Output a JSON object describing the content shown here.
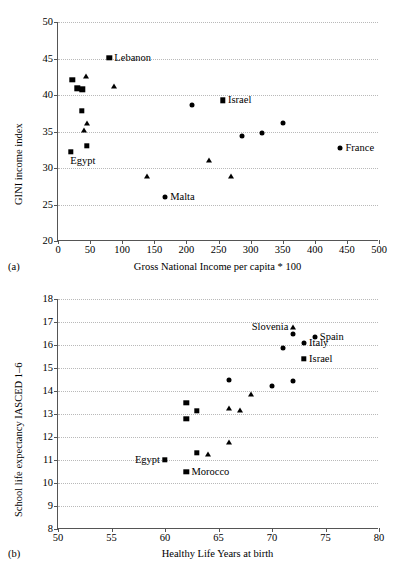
{
  "figure": {
    "panel_a_tag": "(a)",
    "panel_b_tag": "(b)"
  },
  "chart_data": [
    {
      "id": "a",
      "type": "scatter",
      "title": "",
      "xlabel": "Gross National Income per capita * 100",
      "ylabel": "GINI income index",
      "xlim": [
        0,
        500
      ],
      "ylim": [
        20,
        50
      ],
      "xticks": [
        0,
        50,
        100,
        150,
        200,
        250,
        300,
        350,
        400,
        450,
        500
      ],
      "yticks": [
        20,
        25,
        30,
        35,
        40,
        45,
        50
      ],
      "grid": "horizontal-dotted",
      "legend": "none",
      "series": [
        {
          "name": "square-markers",
          "marker": "square",
          "points": [
            {
              "x": 80,
              "y": 45.1,
              "label": "Lebanon",
              "label_pos": "right"
            },
            {
              "x": 22,
              "y": 42.1,
              "label": "",
              "label_pos": ""
            },
            {
              "x": 30,
              "y": 40.9,
              "label": "",
              "label_pos": ""
            },
            {
              "x": 38,
              "y": 40.8,
              "label": "",
              "label_pos": ""
            },
            {
              "x": 37,
              "y": 37.8,
              "label": "",
              "label_pos": ""
            },
            {
              "x": 45,
              "y": 33.0,
              "label": "",
              "label_pos": ""
            },
            {
              "x": 20,
              "y": 32.2,
              "label": "Egypt",
              "label_pos": "below"
            },
            {
              "x": 257,
              "y": 39.3,
              "label": "Israel",
              "label_pos": "right"
            }
          ]
        },
        {
          "name": "triangle-markers",
          "marker": "triangle",
          "points": [
            {
              "x": 44,
              "y": 42.7,
              "label": "",
              "label_pos": ""
            },
            {
              "x": 87,
              "y": 41.3,
              "label": "",
              "label_pos": ""
            },
            {
              "x": 45,
              "y": 36.3,
              "label": "",
              "label_pos": ""
            },
            {
              "x": 41,
              "y": 35.3,
              "label": "",
              "label_pos": ""
            },
            {
              "x": 235,
              "y": 31.2,
              "label": "",
              "label_pos": ""
            },
            {
              "x": 138,
              "y": 29.0,
              "label": "",
              "label_pos": ""
            },
            {
              "x": 269,
              "y": 29.0,
              "label": "",
              "label_pos": ""
            }
          ]
        },
        {
          "name": "circle-markers",
          "marker": "circle",
          "points": [
            {
              "x": 209,
              "y": 38.6,
              "label": "",
              "label_pos": ""
            },
            {
              "x": 351,
              "y": 36.1,
              "label": "",
              "label_pos": ""
            },
            {
              "x": 318,
              "y": 34.8,
              "label": "",
              "label_pos": ""
            },
            {
              "x": 287,
              "y": 34.4,
              "label": "",
              "label_pos": ""
            },
            {
              "x": 440,
              "y": 32.8,
              "label": "France",
              "label_pos": "right"
            },
            {
              "x": 167,
              "y": 26.0,
              "label": "Malta",
              "label_pos": "right"
            }
          ]
        }
      ]
    },
    {
      "id": "b",
      "type": "scatter",
      "title": "",
      "xlabel": "Healthy Life Years at birth",
      "ylabel": "School life expectancy IASCED 1–6",
      "xlim": [
        50,
        80
      ],
      "ylim": [
        8,
        18
      ],
      "xticks": [
        50,
        55,
        60,
        65,
        70,
        75,
        80
      ],
      "yticks": [
        8,
        9,
        10,
        11,
        12,
        13,
        14,
        15,
        16,
        17,
        18
      ],
      "grid": "horizontal-dotted",
      "legend": "none",
      "series": [
        {
          "name": "square-markers",
          "marker": "square",
          "points": [
            {
              "x": 73.0,
              "y": 15.4,
              "label": "Israel",
              "label_pos": "right"
            },
            {
              "x": 62.0,
              "y": 13.5,
              "label": "",
              "label_pos": ""
            },
            {
              "x": 63.0,
              "y": 13.15,
              "label": "",
              "label_pos": ""
            },
            {
              "x": 62.0,
              "y": 12.8,
              "label": "",
              "label_pos": ""
            },
            {
              "x": 63.0,
              "y": 11.3,
              "label": "",
              "label_pos": ""
            },
            {
              "x": 60.0,
              "y": 11.0,
              "label": "Egypt",
              "label_pos": "left"
            },
            {
              "x": 62.0,
              "y": 10.5,
              "label": "Morocco",
              "label_pos": "right"
            }
          ]
        },
        {
          "name": "triangle-markers",
          "marker": "triangle",
          "points": [
            {
              "x": 72.0,
              "y": 16.8,
              "label": "Slovenia",
              "label_pos": "left"
            },
            {
              "x": 68.0,
              "y": 13.9,
              "label": "",
              "label_pos": ""
            },
            {
              "x": 66.0,
              "y": 13.3,
              "label": "",
              "label_pos": ""
            },
            {
              "x": 67.0,
              "y": 13.2,
              "label": "",
              "label_pos": ""
            },
            {
              "x": 66.0,
              "y": 11.8,
              "label": "",
              "label_pos": ""
            },
            {
              "x": 64.0,
              "y": 11.3,
              "label": "",
              "label_pos": ""
            }
          ]
        },
        {
          "name": "circle-markers",
          "marker": "circle",
          "points": [
            {
              "x": 74.0,
              "y": 16.35,
              "label": "Spain",
              "label_pos": "right"
            },
            {
              "x": 72.0,
              "y": 16.5,
              "label": "",
              "label_pos": ""
            },
            {
              "x": 73.0,
              "y": 16.1,
              "label": "Italy",
              "label_pos": "right"
            },
            {
              "x": 71.0,
              "y": 15.85,
              "label": "",
              "label_pos": ""
            },
            {
              "x": 66.0,
              "y": 14.5,
              "label": "",
              "label_pos": ""
            },
            {
              "x": 72.0,
              "y": 14.45,
              "label": "",
              "label_pos": ""
            },
            {
              "x": 70.0,
              "y": 14.2,
              "label": "",
              "label_pos": ""
            }
          ]
        }
      ]
    }
  ]
}
